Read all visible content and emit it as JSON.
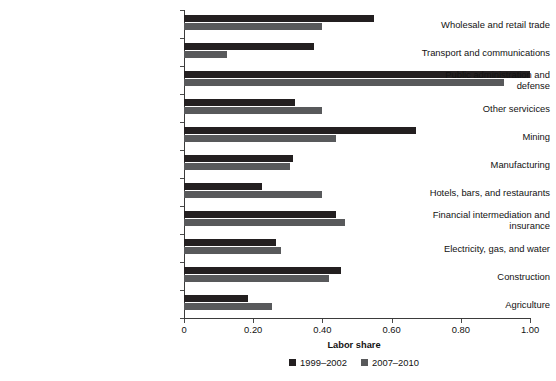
{
  "chart_data": {
    "type": "bar",
    "orientation": "horizontal",
    "title": "",
    "xlabel": "Labor share",
    "ylabel": "",
    "xlim": [
      0,
      1.0
    ],
    "xticks": [
      0,
      0.2,
      0.4,
      0.6,
      0.8,
      1.0
    ],
    "xtick_labels": [
      "0",
      "0.20",
      "0.40",
      "0.60",
      "0.80",
      "1.00"
    ],
    "grid": false,
    "legend_position": "bottom",
    "categories": [
      "Wholesale and retail trade",
      "Transport and communications",
      "Public administration and\ndefense",
      "Other servicices",
      "Mining",
      "Manufacturing",
      "Hotels, bars, and restaurants",
      "Financial intermediation and\ninsurance",
      "Electricity, gas, and water",
      "Construction",
      "Agriculture"
    ],
    "series": [
      {
        "name": "1999–2002",
        "color": "#231f20",
        "values": [
          0.55,
          0.375,
          1.0,
          0.32,
          0.67,
          0.315,
          0.225,
          0.44,
          0.265,
          0.455,
          0.185
        ]
      },
      {
        "name": "2007–2010",
        "color": "#58595b",
        "values": [
          0.4,
          0.125,
          0.925,
          0.4,
          0.44,
          0.305,
          0.4,
          0.465,
          0.28,
          0.42,
          0.255
        ]
      }
    ]
  },
  "axis": {
    "x_title": "Labor share"
  }
}
